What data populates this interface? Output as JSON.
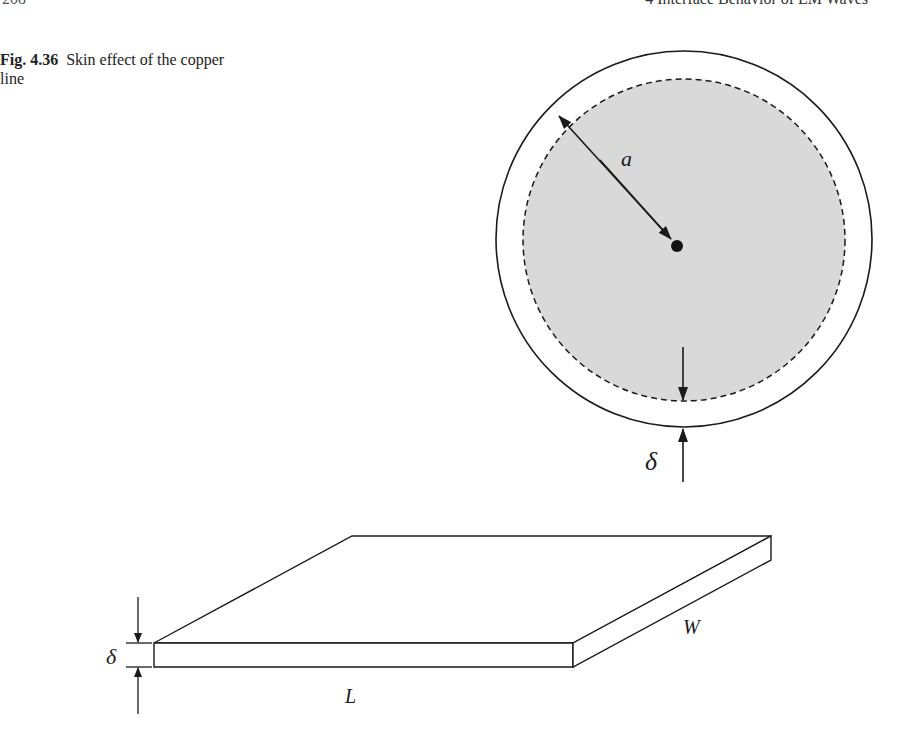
{
  "header": {
    "page_number": "208",
    "chapter_title": "4   Interface Behavior of EM Waves"
  },
  "caption": {
    "figure_label": "Fig. 4.36",
    "text": "Skin effect of the copper line"
  },
  "figure": {
    "circle_cross_section": {
      "radius_label": "a",
      "skin_depth_label": "δ",
      "conductor_fill_color": "#d9d9d9",
      "outline_color": "#1a1a1a"
    },
    "slab": {
      "thickness_label": "δ",
      "length_label": "L",
      "width_label": "W"
    }
  }
}
